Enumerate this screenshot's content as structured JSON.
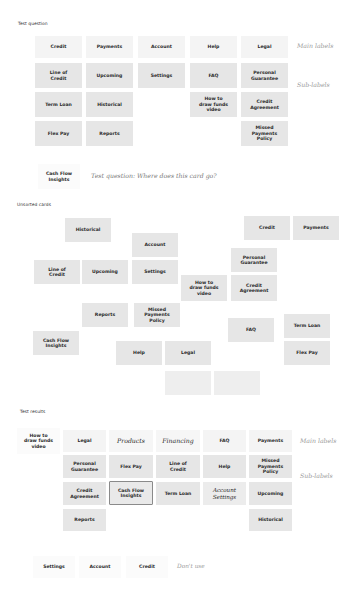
{
  "test_question": {
    "title": "Test question",
    "main_labels_note": "Main labels",
    "sub_labels_note": "Sub-labels",
    "columns": [
      {
        "main": "Credit",
        "subs": [
          "Line of\nCredit",
          "Term Loan",
          "Flex Pay"
        ]
      },
      {
        "main": "Payments",
        "subs": [
          "Upcoming",
          "Historical",
          "Reports"
        ]
      },
      {
        "main": "Account",
        "subs": [
          "Settings"
        ]
      },
      {
        "main": "Help",
        "subs": [
          "FAQ",
          "How to\ndraw funds\nvideo"
        ]
      },
      {
        "main": "Legal",
        "subs": [
          "Personal\nGuarantee",
          "Credit\nAgreement",
          "Missed\nPayments\nPolicy"
        ]
      }
    ],
    "question_card": "Cash Flow\nInsights",
    "question_text": "Test question: Where does this card go?"
  },
  "unsorted": {
    "title": "Unsorted cards",
    "cards": [
      "Historical",
      "Credit",
      "Payments",
      "Account",
      "Personal\nGuarantee",
      "Line of\nCredit",
      "Upcoming",
      "Settings",
      "How to\ndraw funds\nvideo",
      "Credit\nAgreement",
      "Reports",
      "Missed\nPayments\nPolicy",
      "FAQ",
      "Term Loan",
      "Cash Flow\nInsights",
      "Help",
      "Legal",
      "Flex Pay"
    ]
  },
  "test_results": {
    "title": "Test results",
    "main_labels_note": "Main labels",
    "sub_labels_note": "Sub-labels",
    "orphan_card": "How to\ndraw funds\nvideo",
    "columns": [
      {
        "main": "Legal",
        "subs": [
          "Personal\nGuarantee",
          "Credit\nAgreement",
          "Reports"
        ]
      },
      {
        "main": "Products",
        "subs": [
          "Flex Pay",
          "Cash Flow\nInsights"
        ]
      },
      {
        "main": "Financing",
        "subs": [
          "Line of\nCredit",
          "Term Loan"
        ]
      },
      {
        "main": "FAQ",
        "subs": [
          "Help",
          "Account\nSettings"
        ]
      },
      {
        "main": "Payments",
        "subs": [
          "Missed\nPayments\nPolicy",
          "Upcoming",
          "Historical"
        ]
      }
    ],
    "dont_use": {
      "cards": [
        "Settings",
        "Account",
        "Credit"
      ],
      "note": "Don't use"
    }
  }
}
